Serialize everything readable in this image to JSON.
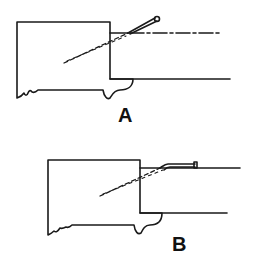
{
  "figure": {
    "panels": [
      {
        "id": "A",
        "label": "A",
        "description": "Needle inserted at an angle through tissue layers"
      },
      {
        "id": "B",
        "label": "B",
        "description": "Needle advanced flattened along the plane"
      }
    ]
  },
  "colors": {
    "stroke": "#1a1a1a",
    "background": "#ffffff"
  }
}
